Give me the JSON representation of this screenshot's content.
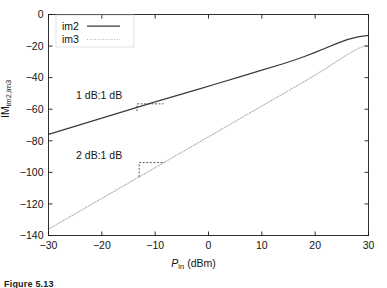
{
  "figure": {
    "caption_fragment": "Figure 5.13",
    "background_color": "#ffffff"
  },
  "chart_data": {
    "type": "line",
    "title": "",
    "xlabel": "P_in (dBm)",
    "ylabel": "IM_im2,im3",
    "xlabel_main": "P",
    "xlabel_sub": "in",
    "xlabel_unit": " (dBm)",
    "ylabel_main": "IM",
    "ylabel_sub": "im2,im3",
    "xlim": [
      -30,
      30
    ],
    "ylim": [
      -140,
      0
    ],
    "xticks": [
      -30,
      -20,
      -10,
      0,
      10,
      20,
      30
    ],
    "xticklabels": [
      "−30",
      "−20",
      "−10",
      "0",
      "10",
      "20",
      "30"
    ],
    "yticks": [
      0,
      -20,
      -40,
      -60,
      -80,
      -100,
      -120,
      -140
    ],
    "yticklabels": [
      "0",
      "−20",
      "−40",
      "−60",
      "−80",
      "−100",
      "−120",
      "−140"
    ],
    "grid": false,
    "legend_position": "upper left",
    "series": [
      {
        "name": "im2",
        "style": "solid",
        "color": "#3a3a3a",
        "slope_label": "1 dB:1 dB",
        "x": [
          -30,
          -26,
          -22,
          -18,
          -14,
          -10,
          -6,
          -2,
          2,
          6,
          10,
          14,
          16,
          18,
          20,
          22,
          24,
          26,
          28,
          30
        ],
        "y": [
          -76.0,
          -71.8,
          -67.7,
          -63.6,
          -59.5,
          -55.4,
          -51.4,
          -47.4,
          -43.4,
          -39.4,
          -35.3,
          -31.2,
          -29.0,
          -26.6,
          -24.0,
          -21.2,
          -18.4,
          -15.9,
          -14.2,
          -13.2
        ]
      },
      {
        "name": "im3",
        "style": "dotted",
        "color": "#b2b2b2",
        "slope_label": "2 dB:1 dB",
        "x": [
          -30,
          -26,
          -22,
          -18,
          -14,
          -10,
          -6,
          -2,
          2,
          6,
          10,
          14,
          16,
          18,
          20,
          22,
          24,
          26,
          28,
          30
        ],
        "y": [
          -136.0,
          -128.2,
          -120.4,
          -112.6,
          -104.8,
          -97.0,
          -89.2,
          -81.4,
          -73.6,
          -65.8,
          -58.0,
          -50.2,
          -46.3,
          -42.4,
          -38.4,
          -34.2,
          -29.8,
          -25.4,
          -21.6,
          -19.2
        ]
      }
    ],
    "annotations": [
      {
        "id": "slope-1db",
        "label": "1 dB:1 dB",
        "text_x": -20.5,
        "text_y": -53.5,
        "step_x0": -13.4,
        "step_x1": -8.4,
        "step_y_top": -56.6,
        "step_y_bot": -61.2
      },
      {
        "id": "slope-2db",
        "label": "2 dB:1 dB",
        "text_x": -20.5,
        "text_y": -91.5,
        "step_x0": -13.0,
        "step_x1": -8.2,
        "step_y_top": -93.8,
        "step_y_bot": -103.0
      }
    ],
    "legend": [
      {
        "label": "im2",
        "style": "solid",
        "color": "#3a3a3a"
      },
      {
        "label": "im3",
        "style": "dotted",
        "color": "#b2b2b2"
      }
    ]
  }
}
